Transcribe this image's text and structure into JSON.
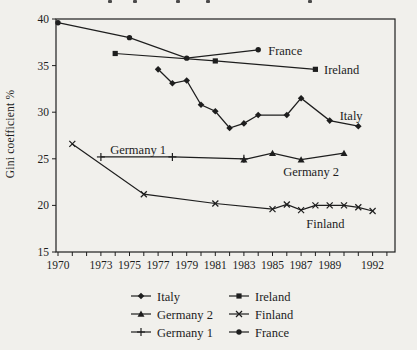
{
  "figure": {
    "background": "#f1f0ec",
    "ink": "#1e1e1e",
    "cropped_title_fragment_xs": [
      108,
      133,
      176,
      206,
      308
    ]
  },
  "chart_data": {
    "type": "line",
    "title": "",
    "xlabel": "",
    "ylabel": "Gini coefficient %",
    "xlim": [
      1969.85,
      1993.6
    ],
    "ylim": [
      15,
      40
    ],
    "grid": false,
    "x_ticks_labeled": [
      1970,
      1973,
      1975,
      1977,
      1979,
      1981,
      1983,
      1985,
      1987,
      1989,
      1992
    ],
    "x_ticks_minor": "every year 1970-1993",
    "y_ticks": [
      15,
      20,
      25,
      30,
      35,
      40
    ],
    "legend_position": "bottom-center, two columns",
    "series": [
      {
        "name": "France",
        "marker": "circle",
        "points": [
          [
            1970,
            39.6
          ],
          [
            1975,
            38.0
          ],
          [
            1979,
            35.8
          ],
          [
            1984,
            36.7
          ]
        ],
        "label": {
          "text": "France",
          "x": 1984.7,
          "y": 36.6,
          "anchor": "start"
        }
      },
      {
        "name": "Ireland",
        "marker": "square",
        "points": [
          [
            1974,
            36.3
          ],
          [
            1981,
            35.5
          ],
          [
            1988,
            34.6
          ]
        ],
        "label": {
          "text": "Ireland",
          "x": 1988.6,
          "y": 34.5,
          "anchor": "start"
        }
      },
      {
        "name": "Italy",
        "marker": "diamond",
        "points": [
          [
            1977,
            34.6
          ],
          [
            1978,
            33.1
          ],
          [
            1979,
            33.4
          ],
          [
            1980,
            30.8
          ],
          [
            1981,
            30.1
          ],
          [
            1982,
            28.3
          ],
          [
            1983,
            28.8
          ],
          [
            1984,
            29.7
          ],
          [
            1986,
            29.7
          ],
          [
            1987,
            31.5
          ],
          [
            1989,
            29.1
          ],
          [
            1991,
            28.5
          ]
        ],
        "label": {
          "text": "Italy",
          "x": 1989.7,
          "y": 29.6,
          "anchor": "start"
        }
      },
      {
        "name": "Germany 1",
        "marker": "plus",
        "points": [
          [
            1973,
            25.2
          ],
          [
            1978,
            25.2
          ],
          [
            1983,
            25.0
          ]
        ],
        "label": {
          "text": "Germany 1",
          "x": 1975.6,
          "y": 25.9,
          "anchor": "middle"
        }
      },
      {
        "name": "Germany 2",
        "marker": "triangle",
        "points": [
          [
            1983,
            24.9
          ],
          [
            1985,
            25.6
          ],
          [
            1987,
            24.9
          ],
          [
            1990,
            25.6
          ]
        ],
        "label": {
          "text": "Germany 2",
          "x": 1987.7,
          "y": 23.6,
          "anchor": "middle"
        }
      },
      {
        "name": "Finland",
        "marker": "cross",
        "points": [
          [
            1971,
            26.6
          ],
          [
            1976,
            21.2
          ],
          [
            1981,
            20.2
          ],
          [
            1985,
            19.6
          ],
          [
            1986,
            20.1
          ],
          [
            1987,
            19.5
          ],
          [
            1988,
            20.0
          ],
          [
            1989,
            20.0
          ],
          [
            1990,
            20.0
          ],
          [
            1991,
            19.8
          ],
          [
            1992,
            19.4
          ]
        ],
        "label": {
          "text": "Finland",
          "x": 1988.7,
          "y": 18.0,
          "anchor": "middle"
        }
      }
    ],
    "legend": {
      "left_column": [
        "Italy",
        "Germany 2",
        "Germany 1"
      ],
      "right_column": [
        "Ireland",
        "Finland",
        "France"
      ]
    }
  }
}
